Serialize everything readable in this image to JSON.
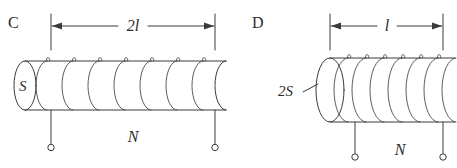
{
  "figure": {
    "background_color": "#ffffff",
    "line_color": "#3a3a3a",
    "panels": [
      {
        "id": "C",
        "panel_label": "C",
        "dimension_label": "2l",
        "area_label": "S",
        "turns_label": "N",
        "turn_count_drawn": 7,
        "relative_length": "2l",
        "relative_area": "S"
      },
      {
        "id": "D",
        "panel_label": "D",
        "dimension_label": "l",
        "area_label": "2S",
        "turns_label": "N",
        "turn_count_drawn": 7,
        "relative_length": "l",
        "relative_area": "2S"
      }
    ]
  }
}
